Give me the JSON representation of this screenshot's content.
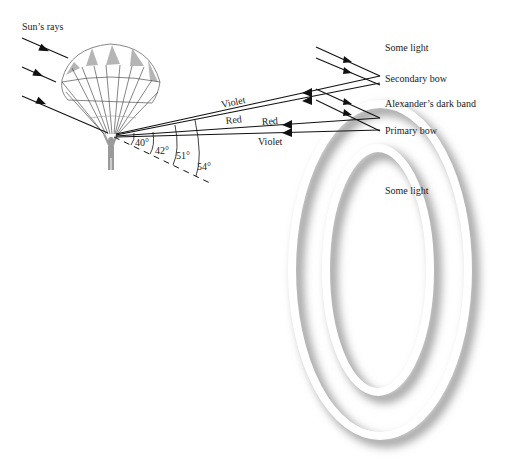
{
  "figure": {
    "labels": {
      "sun_rays": "Sun’s rays",
      "some_light_top": "Some light",
      "secondary_bow": "Secondary bow",
      "dark_band": "Alexander’s dark band",
      "primary_bow": "Primary bow",
      "some_light_inner": "Some light"
    },
    "ray_labels": {
      "secondary_violet": "Violet",
      "secondary_red": "Red",
      "primary_red": "Red",
      "primary_violet": "Violet"
    },
    "angles": [
      "40°",
      "42°",
      "51°",
      "54°"
    ],
    "colors": {
      "line": "#111111",
      "bow_shadow": "#9a9a9a",
      "canopy_gray": "#b5b5b5"
    }
  }
}
